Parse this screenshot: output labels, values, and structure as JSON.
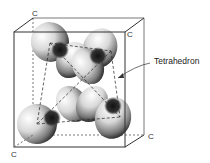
{
  "figure": {
    "labels": {
      "corner_top_back_left": "C",
      "corner_top_front_right": "C",
      "corner_bottom_back_right": "C",
      "corner_bottom_front_left": "C",
      "callout": "Tetrahedron"
    },
    "colors": {
      "line": "#333333",
      "lobe_light": "#ffffff",
      "lobe_dark": "#222222",
      "background": "#ffffff"
    }
  }
}
